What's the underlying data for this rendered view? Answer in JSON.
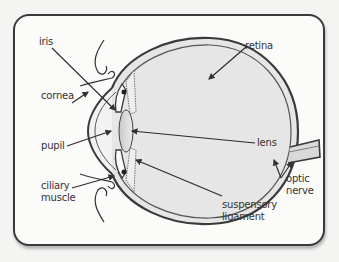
{
  "diagram": {
    "title": "",
    "labels": {
      "iris": "iris",
      "retina": "retina",
      "cornea": "cornea",
      "lens": "lens",
      "pupil": "pupil",
      "optic_nerve_line1": "optic",
      "optic_nerve_line2": "nerve",
      "ciliary_muscle_line1": "ciliary",
      "ciliary_muscle_line2": "muscle",
      "suspensory_ligament_line1": "suspensory",
      "suspensory_ligament_line2": "ligament"
    },
    "colors": {
      "frame_border": "#3a3a3a",
      "background": "#fbfbfa",
      "eyeball_fill": "#e4e4e4",
      "lens_fill": "#d8d8d8",
      "outline": "#3a3a3a",
      "text": "#333333"
    }
  }
}
